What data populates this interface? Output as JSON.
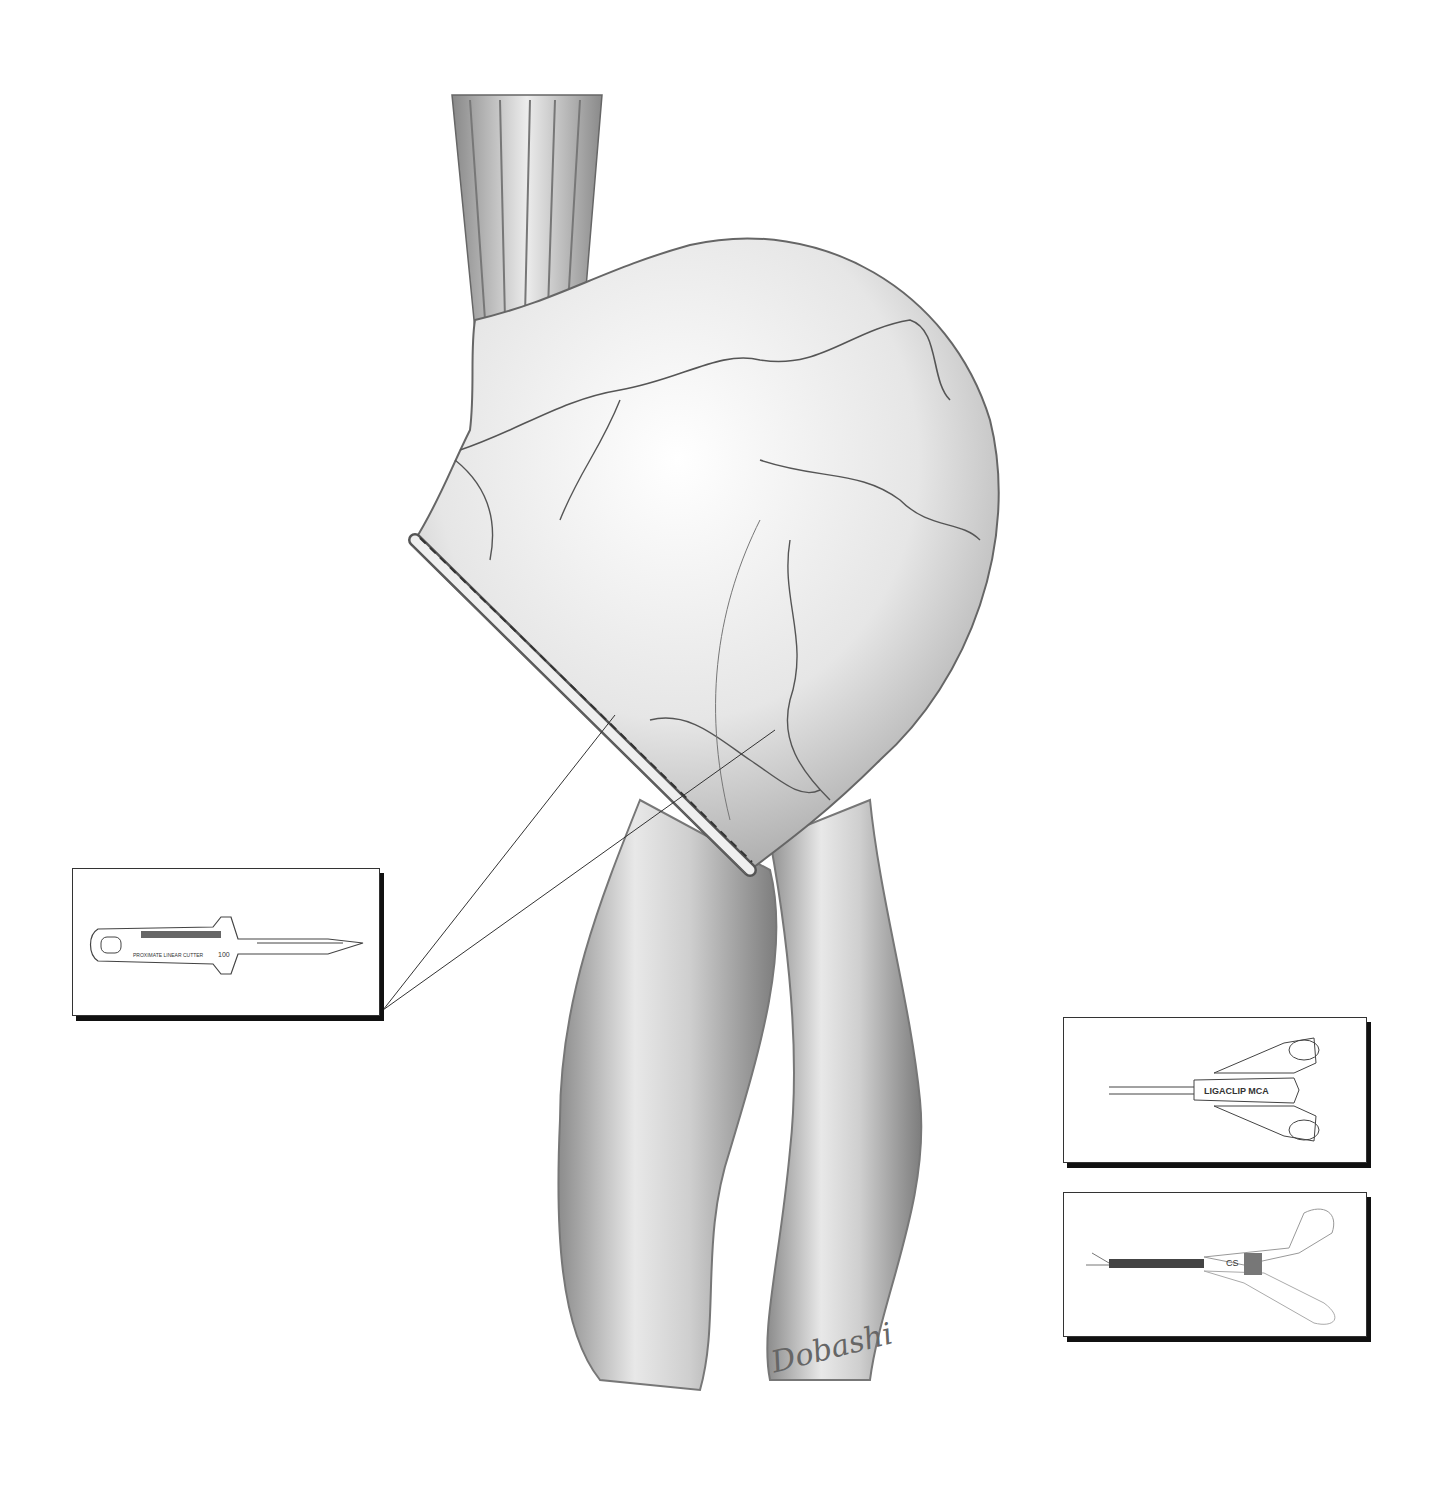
{
  "figure": {
    "background": "#ffffff",
    "ink_color": "#4a4a4a",
    "signature": "Dobashi"
  },
  "insets": [
    {
      "id": "linear-cutter",
      "label": "PROXIMATE LINEAR CUTTER",
      "size_marking": "100",
      "position": "left"
    },
    {
      "id": "ligaclip",
      "label_small": "ETHICON",
      "label": "LIGACLIP MCA",
      "position": "right-top"
    },
    {
      "id": "clip-applier",
      "label": "CS",
      "position": "right-bottom"
    }
  ]
}
